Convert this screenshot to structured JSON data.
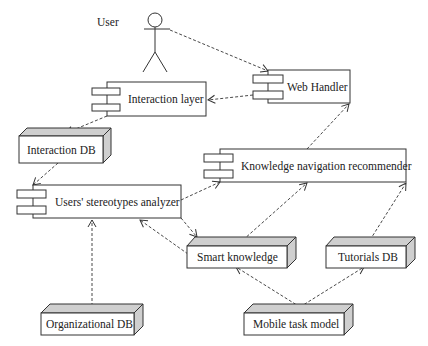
{
  "diagram": {
    "type": "UML component/deployment diagram",
    "actor": {
      "label": "User"
    },
    "components": [
      {
        "id": "interaction_layer",
        "label": "Interaction layer"
      },
      {
        "id": "web_handler",
        "label": "Web Handler"
      },
      {
        "id": "stereotypes_analyzer",
        "label": "Users' stereotypes analyzer"
      },
      {
        "id": "knowledge_nav",
        "label": "Knowledge navigation recommender"
      }
    ],
    "nodes": [
      {
        "id": "interaction_db",
        "label": "Interaction DB"
      },
      {
        "id": "smart_knowledge",
        "label": "Smart knowledge"
      },
      {
        "id": "tutorials_db",
        "label": "Tutorials DB"
      },
      {
        "id": "organizational_db",
        "label": "Organizational DB"
      },
      {
        "id": "mobile_task_model",
        "label": "Mobile task model"
      }
    ],
    "dependencies": [
      {
        "from": "User",
        "to": "Web Handler"
      },
      {
        "from": "Web Handler",
        "to": "Interaction layer"
      },
      {
        "from": "Interaction layer",
        "to": "Interaction DB"
      },
      {
        "from": "Interaction DB",
        "to": "Users' stereotypes analyzer"
      },
      {
        "from": "Users' stereotypes analyzer",
        "to": "Knowledge navigation recommender"
      },
      {
        "from": "Users' stereotypes analyzer",
        "to": "Smart knowledge"
      },
      {
        "from": "Smart knowledge",
        "to": "Users' stereotypes analyzer"
      },
      {
        "from": "Smart knowledge",
        "to": "Knowledge navigation recommender"
      },
      {
        "from": "Tutorials DB",
        "to": "Knowledge navigation recommender"
      },
      {
        "from": "Knowledge navigation recommender",
        "to": "Web Handler"
      },
      {
        "from": "Organizational DB",
        "to": "Users' stereotypes analyzer"
      },
      {
        "from": "Mobile task model",
        "to": "Smart knowledge"
      },
      {
        "from": "Mobile task model",
        "to": "Tutorials DB"
      }
    ]
  },
  "colors": {
    "line": "#333333",
    "node_side": "#cfcfcf",
    "node_front": "#ffffff"
  }
}
